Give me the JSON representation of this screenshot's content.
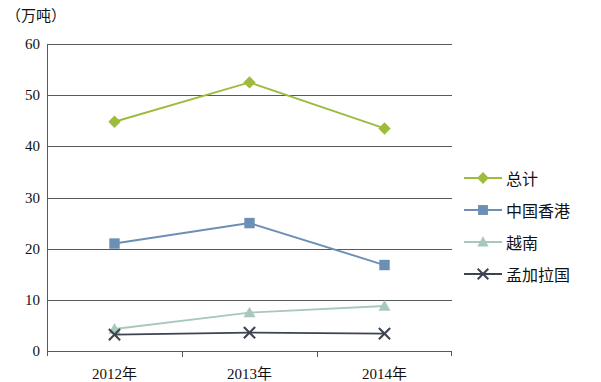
{
  "chart_data": {
    "type": "line",
    "title": "",
    "subtitle": "",
    "xlabel": "",
    "ylabel": "（万吨）",
    "unit_label": "（万吨）",
    "categories": [
      "2012年",
      "2013年",
      "2014年"
    ],
    "ylim": [
      0,
      60
    ],
    "ytick_step": 10,
    "ytick_labels": [
      "60",
      "50",
      "40",
      "30",
      "20",
      "10",
      "0"
    ],
    "ytick_values": [
      60,
      50,
      40,
      30,
      20,
      10,
      0
    ],
    "grid": true,
    "grid_axis": "y",
    "legend_position": "right",
    "series": [
      {
        "name": "总计",
        "values": [
          44.8,
          52.5,
          43.5
        ],
        "color": "#9DBB3C",
        "marker": "diamond"
      },
      {
        "name": "中国香港",
        "values": [
          21.0,
          25.0,
          16.8
        ],
        "color": "#6B8FB5",
        "marker": "square"
      },
      {
        "name": "越南",
        "values": [
          4.3,
          7.5,
          8.8
        ],
        "color": "#A8C8BC",
        "marker": "triangle"
      },
      {
        "name": "孟加拉国",
        "values": [
          3.2,
          3.6,
          3.4
        ],
        "color": "#3C4450",
        "marker": "cross"
      }
    ]
  },
  "legend": {
    "items": [
      {
        "label": "总计"
      },
      {
        "label": "中国香港"
      },
      {
        "label": "越南"
      },
      {
        "label": "孟加拉国"
      }
    ]
  },
  "axes": {
    "y_unit": "（万吨）",
    "y_ticks": [
      "60",
      "50",
      "40",
      "30",
      "20",
      "10",
      "0"
    ],
    "x_categories": [
      "2012年",
      "2013年",
      "2014年"
    ]
  }
}
